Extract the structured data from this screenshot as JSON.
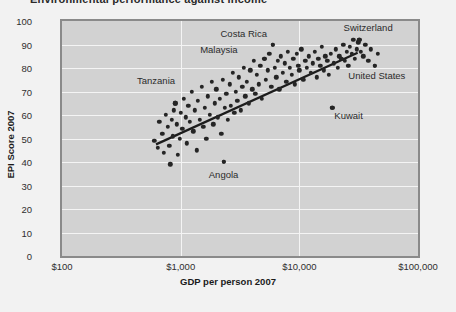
{
  "chart_title": "Environmental performance against income",
  "chart_data": {
    "type": "scatter",
    "title": "Environmental performance against income",
    "xlabel": "GDP per person 2007",
    "ylabel": "EPI Score 2007",
    "xscale": "log",
    "xlim": [
      100,
      100000
    ],
    "ylim": [
      0,
      100
    ],
    "xticks": [
      "$100",
      "$1,000",
      "$10,000",
      "$100,000"
    ],
    "xtick_values": [
      100,
      1000,
      10000,
      100000
    ],
    "yticks": [
      0,
      10,
      20,
      30,
      40,
      50,
      60,
      70,
      80,
      90,
      100
    ],
    "grid": "white gridlines on gray panel",
    "legend": "none",
    "marker_color": "#252525",
    "panel_color": "#d2d2d2",
    "trendline": {
      "label": "linear fit on log(GDP)",
      "color": "#1c1c1c",
      "x_start": 620,
      "y_start": 47.5,
      "x_end": 31000,
      "y_end": 86.5
    },
    "annotations": [
      {
        "label": "Switzerland",
        "x": 38000,
        "y": 97.5,
        "point_x": 32000,
        "point_y": 92
      },
      {
        "label": "Costa Rica",
        "x": 3400,
        "y": 95,
        "point_x": 6000,
        "point_y": 90
      },
      {
        "label": "Malaysia",
        "x": 2100,
        "y": 88,
        "point_x": 5100,
        "point_y": 84
      },
      {
        "label": "Tanzania",
        "x": 620,
        "y": 75,
        "point_x": 900,
        "point_y": 65
      },
      {
        "label": "United States",
        "x": 45000,
        "y": 77,
        "point_x": 43000,
        "point_y": 81
      },
      {
        "label": "Kuwait",
        "x": 26000,
        "y": 60,
        "point_x": 19000,
        "point_y": 63
      },
      {
        "label": "Angola",
        "x": 2300,
        "y": 35,
        "point_x": 2300,
        "point_y": 40
      }
    ],
    "points": [
      [
        600,
        49
      ],
      [
        640,
        46
      ],
      [
        660,
        57
      ],
      [
        700,
        52
      ],
      [
        720,
        44
      ],
      [
        750,
        60
      ],
      [
        780,
        55
      ],
      [
        800,
        47
      ],
      [
        820,
        39
      ],
      [
        840,
        58
      ],
      [
        860,
        51
      ],
      [
        880,
        62
      ],
      [
        900,
        65
      ],
      [
        930,
        56
      ],
      [
        950,
        43
      ],
      [
        980,
        50
      ],
      [
        1000,
        61
      ],
      [
        1030,
        54
      ],
      [
        1060,
        67
      ],
      [
        1100,
        59
      ],
      [
        1130,
        48
      ],
      [
        1160,
        64
      ],
      [
        1200,
        57
      ],
      [
        1240,
        70
      ],
      [
        1280,
        53
      ],
      [
        1320,
        62
      ],
      [
        1360,
        45
      ],
      [
        1400,
        66
      ],
      [
        1450,
        58
      ],
      [
        1500,
        72
      ],
      [
        1550,
        55
      ],
      [
        1600,
        63
      ],
      [
        1650,
        50
      ],
      [
        1700,
        68
      ],
      [
        1760,
        60
      ],
      [
        1820,
        74
      ],
      [
        1880,
        56
      ],
      [
        1940,
        65
      ],
      [
        2000,
        71
      ],
      [
        2060,
        59
      ],
      [
        2130,
        67
      ],
      [
        2200,
        52
      ],
      [
        2270,
        75
      ],
      [
        2300,
        40
      ],
      [
        2350,
        63
      ],
      [
        2420,
        69
      ],
      [
        2500,
        58
      ],
      [
        2580,
        73
      ],
      [
        2660,
        64
      ],
      [
        2740,
        78
      ],
      [
        2830,
        61
      ],
      [
        2920,
        70
      ],
      [
        3000,
        66
      ],
      [
        3100,
        76
      ],
      [
        3200,
        62
      ],
      [
        3300,
        72
      ],
      [
        3400,
        80
      ],
      [
        3500,
        68
      ],
      [
        3620,
        74
      ],
      [
        3740,
        65
      ],
      [
        3860,
        79
      ],
      [
        4000,
        71
      ],
      [
        4130,
        83
      ],
      [
        4270,
        69
      ],
      [
        4400,
        77
      ],
      [
        4550,
        73
      ],
      [
        4700,
        81
      ],
      [
        4850,
        67
      ],
      [
        5000,
        84
      ],
      [
        5100,
        84
      ],
      [
        5200,
        75
      ],
      [
        5400,
        79
      ],
      [
        5600,
        86
      ],
      [
        5800,
        72
      ],
      [
        6000,
        90
      ],
      [
        6200,
        80
      ],
      [
        6400,
        76
      ],
      [
        6600,
        83
      ],
      [
        6800,
        71
      ],
      [
        7000,
        85
      ],
      [
        7250,
        78
      ],
      [
        7500,
        82
      ],
      [
        7750,
        74
      ],
      [
        8000,
        87
      ],
      [
        8300,
        80
      ],
      [
        8600,
        77
      ],
      [
        8900,
        84
      ],
      [
        9200,
        73
      ],
      [
        9500,
        86
      ],
      [
        9800,
        81
      ],
      [
        10000,
        79
      ],
      [
        10400,
        88
      ],
      [
        10800,
        75
      ],
      [
        11200,
        83
      ],
      [
        11600,
        80
      ],
      [
        12000,
        85
      ],
      [
        12500,
        78
      ],
      [
        13000,
        82
      ],
      [
        13500,
        87
      ],
      [
        14000,
        76
      ],
      [
        14500,
        84
      ],
      [
        15000,
        81
      ],
      [
        15500,
        89
      ],
      [
        16000,
        79
      ],
      [
        16600,
        85
      ],
      [
        17200,
        83
      ],
      [
        17800,
        77
      ],
      [
        18400,
        86
      ],
      [
        19000,
        63
      ],
      [
        19600,
        82
      ],
      [
        20300,
        88
      ],
      [
        21000,
        80
      ],
      [
        21800,
        85
      ],
      [
        22600,
        84
      ],
      [
        23400,
        90
      ],
      [
        24200,
        83
      ],
      [
        25000,
        87
      ],
      [
        25800,
        81
      ],
      [
        26700,
        89
      ],
      [
        27600,
        86
      ],
      [
        28500,
        92
      ],
      [
        29500,
        84
      ],
      [
        30500,
        88
      ],
      [
        31500,
        91
      ],
      [
        32000,
        92
      ],
      [
        33000,
        87
      ],
      [
        34500,
        85
      ],
      [
        36000,
        90
      ],
      [
        38000,
        83
      ],
      [
        40000,
        88
      ],
      [
        43000,
        81
      ],
      [
        46000,
        86
      ]
    ]
  }
}
